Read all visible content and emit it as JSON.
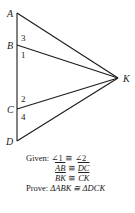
{
  "diagram": {
    "points": [
      {
        "name": "A",
        "x": 17,
        "y": 13
      },
      {
        "name": "B",
        "x": 17,
        "y": 45
      },
      {
        "name": "C",
        "x": 17,
        "y": 109
      },
      {
        "name": "D",
        "x": 17,
        "y": 141
      },
      {
        "name": "K",
        "x": 118,
        "y": 78
      }
    ],
    "segments": [
      "AD",
      "AK",
      "BK",
      "CK",
      "DK"
    ],
    "labels": {
      "A": "A",
      "B": "B",
      "C": "C",
      "D": "D",
      "K": "K"
    },
    "angle_labels": {
      "a1": "1",
      "a2": "2",
      "a3": "3",
      "a4": "4"
    }
  },
  "given": {
    "label": "Given:",
    "line1": "∠1 ≅ ∠2",
    "line2_left": "AB",
    "line2_right": "DC",
    "line3_left": "BK",
    "line3_right": "CK",
    "congruent": "≅"
  },
  "prove": {
    "label": "Prove:",
    "statement": "ΔABK ≅ ΔDCK"
  }
}
